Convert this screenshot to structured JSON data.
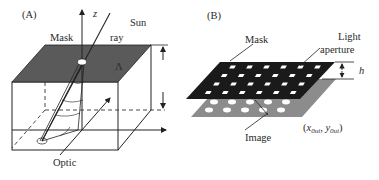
{
  "figure": {
    "panels": [
      {
        "id": "A",
        "label": "(A)",
        "labels": {
          "mask": "Mask",
          "sun": "Sun",
          "ray": "ray",
          "z_axis": "z",
          "aperture_symbol": "Λ",
          "optic": "Optic"
        }
      },
      {
        "id": "B",
        "label": "(B)",
        "labels": {
          "mask": "Mask",
          "light": "Light",
          "aperture": "aperture",
          "height": "h",
          "image": "Image",
          "coord_open": "(",
          "coord_x": "x",
          "coord_x_sub": "0ui",
          "coord_sep": ", ",
          "coord_y": "y",
          "coord_y_sub": "0ui",
          "coord_close": ")"
        }
      }
    ],
    "colors": {
      "mask_top_a": "#5a5a5a",
      "mask_b": "#1a1a1a",
      "image_plane_b": "#8c8c8c",
      "aperture": "#ffffff",
      "line": "#222222"
    },
    "grid_b": {
      "mask_rows": 4,
      "mask_cols": 6,
      "image_rows": 2,
      "image_cols": 6
    }
  }
}
